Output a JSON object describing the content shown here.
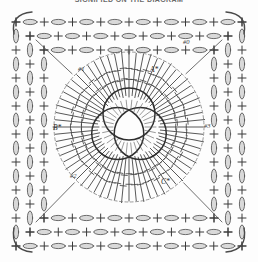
{
  "title": "SIGNIFIED ON THE DIAGRAM",
  "diagram": {
    "type": "crochet-chart",
    "shape": "square-motif",
    "background_color": "#fdfdfd",
    "ink_color": "#3a3a3a",
    "labels": [
      {
        "id": "round-0",
        "text": "#0",
        "x": 183,
        "y": 44
      },
      {
        "id": "round-1",
        "text": "#1",
        "x": 78,
        "y": 71
      },
      {
        "id": "round-2",
        "text": "#2",
        "x": 70,
        "y": 178
      },
      {
        "id": "round-3",
        "text": "#3",
        "x": 204,
        "y": 128
      },
      {
        "id": "point-a",
        "text": "A*",
        "x": 150,
        "y": 72
      },
      {
        "id": "point-b",
        "text": "B*",
        "x": 53,
        "y": 130
      },
      {
        "id": "point-c",
        "text": "C*",
        "x": 161,
        "y": 184
      }
    ],
    "center": {
      "rings": 3,
      "cx": 129,
      "cy": 127,
      "ring_radius": 26,
      "description": "three interlocking rings"
    },
    "stitches": {
      "chain_symbol": "oval",
      "single_crochet_symbol": "cross",
      "treble_symbol": "bar-with-crossbar",
      "radiating_count": 64
    },
    "border": {
      "rows": 3,
      "corner_style": "curved-chain-loop"
    }
  }
}
